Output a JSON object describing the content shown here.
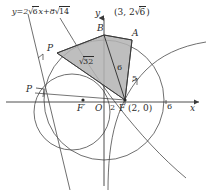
{
  "figure": {
    "type": "geometry-diagram",
    "axes": {
      "x_label": "x",
      "y_label": "y",
      "origin_label": "O"
    },
    "tick_labels": [
      {
        "text": "2",
        "axis": "x"
      },
      {
        "text": "6",
        "axis": "x"
      }
    ],
    "points": [
      {
        "name": "B",
        "label": "B"
      },
      {
        "name": "A",
        "label": "A"
      },
      {
        "name": "P-upper",
        "label": "P"
      },
      {
        "name": "P-foot",
        "label": "P"
      },
      {
        "name": "F-prime",
        "label": "F′"
      },
      {
        "name": "F",
        "label": "F"
      }
    ],
    "coordinate_labels": [
      {
        "name": "A-coordinates",
        "text": "(3, 2√6)",
        "prefix": "(3, 2",
        "radicand": "6",
        "suffix": ")"
      },
      {
        "name": "F-coordinates",
        "text": "F (2, 0)",
        "point": "F",
        "coords": "(2, 0)"
      }
    ],
    "line_equation": {
      "name": "tangent-line-equation",
      "text": "y = 2√6x + 8√14",
      "lhs": "y",
      "equals": "=",
      "coef_prefix": "2",
      "coef_radicand": "6",
      "variable": "x",
      "plus": "+",
      "const_prefix": "8",
      "const_radicand": "14"
    },
    "segment_lengths": [
      {
        "name": "segment-PB-length",
        "text": "√32",
        "radicand": "32"
      },
      {
        "name": "segment-BF-length",
        "text": "6"
      },
      {
        "name": "segment-AF-length",
        "text": "5"
      }
    ],
    "colors": {
      "stroke": "#3a3a3a",
      "shaded_fill": "#b3b3b3",
      "shaded_stroke": "#4a4a4a",
      "text": "#2b2b2b",
      "background": "#ffffff"
    },
    "shaded_region": {
      "name": "shaded-quadrilateral",
      "vertices": [
        "P",
        "B",
        "A",
        "F"
      ]
    }
  }
}
